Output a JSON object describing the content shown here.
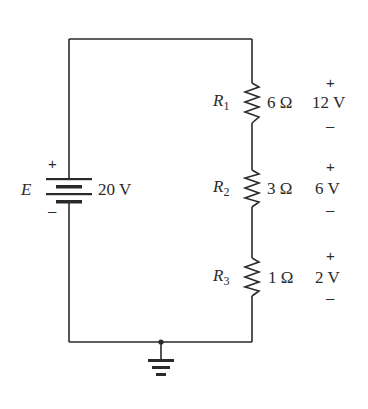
{
  "source": {
    "name": "E",
    "value": "20 V",
    "plus": "+",
    "minus": "–"
  },
  "resistors": [
    {
      "name": "R",
      "sub": "1",
      "value": "6 Ω",
      "voltage": "12 V",
      "plus": "+",
      "minus": "–"
    },
    {
      "name": "R",
      "sub": "2",
      "value": "3 Ω",
      "voltage": "6 V",
      "plus": "+",
      "minus": "–"
    },
    {
      "name": "R",
      "sub": "3",
      "value": "1 Ω",
      "voltage": "2 V",
      "plus": "+",
      "minus": "–"
    }
  ],
  "colors": {
    "wire": "#2a2a2a",
    "background": "#ffffff"
  }
}
